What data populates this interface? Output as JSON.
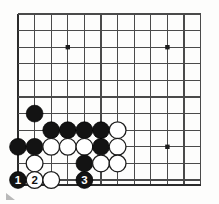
{
  "figure": {
    "kind": "go-board-diagram",
    "board_color": "#fdfdfc",
    "line_color": "#4a4a4a",
    "edge_line_color": "#2b2b2b",
    "black_color": "#131313",
    "white_color": "#ffffff"
  },
  "board": {
    "origin_x": 18,
    "origin_y": 14,
    "spacing": 16.6,
    "cols": 12,
    "rows": 11,
    "bottom_edge_y": 185,
    "star_points": [
      {
        "name": "star-point-upper-left",
        "col": 3,
        "row": 2
      },
      {
        "name": "star-point-upper-right",
        "col": 9,
        "row": 2
      },
      {
        "name": "star-point-lower-right",
        "col": 9,
        "row": 8
      }
    ]
  },
  "stones": [
    {
      "name": "stone-black-a",
      "color": "black",
      "col": 1,
      "row": 6,
      "label": ""
    },
    {
      "name": "stone-black-b",
      "color": "black",
      "col": 2,
      "row": 7,
      "label": ""
    },
    {
      "name": "stone-black-c",
      "color": "black",
      "col": 3,
      "row": 7,
      "label": ""
    },
    {
      "name": "stone-black-d",
      "color": "black",
      "col": 4,
      "row": 7,
      "label": ""
    },
    {
      "name": "stone-black-e",
      "color": "black",
      "col": 5,
      "row": 7,
      "label": ""
    },
    {
      "name": "stone-white-f",
      "color": "white",
      "col": 6,
      "row": 7,
      "label": ""
    },
    {
      "name": "stone-black-g",
      "color": "black",
      "col": 0,
      "row": 8,
      "label": ""
    },
    {
      "name": "stone-black-h",
      "color": "black",
      "col": 1,
      "row": 8,
      "label": ""
    },
    {
      "name": "stone-white-i",
      "color": "white",
      "col": 2,
      "row": 8,
      "label": ""
    },
    {
      "name": "stone-white-j",
      "color": "white",
      "col": 3,
      "row": 8,
      "label": ""
    },
    {
      "name": "stone-white-k",
      "color": "white",
      "col": 4,
      "row": 8,
      "label": ""
    },
    {
      "name": "stone-black-l",
      "color": "black",
      "col": 5,
      "row": 8,
      "label": ""
    },
    {
      "name": "stone-white-m",
      "color": "white",
      "col": 6,
      "row": 8,
      "label": ""
    },
    {
      "name": "stone-white-n",
      "color": "white",
      "col": 1,
      "row": 9,
      "label": ""
    },
    {
      "name": "stone-black-o",
      "color": "black",
      "col": 4,
      "row": 9,
      "label": ""
    },
    {
      "name": "stone-white-p",
      "color": "white",
      "col": 5,
      "row": 9,
      "label": ""
    },
    {
      "name": "stone-white-q",
      "color": "white",
      "col": 6,
      "row": 9,
      "label": ""
    },
    {
      "name": "stone-move-1",
      "color": "black",
      "col": 0,
      "row": 10,
      "label": "1"
    },
    {
      "name": "stone-move-2",
      "color": "white",
      "col": 1,
      "row": 10,
      "label": "2"
    },
    {
      "name": "stone-white-r",
      "color": "white",
      "col": 2,
      "row": 10,
      "label": ""
    },
    {
      "name": "stone-move-3",
      "color": "black",
      "col": 4,
      "row": 10,
      "label": "3"
    }
  ],
  "move_sequence": [
    {
      "number": "1",
      "color": "black"
    },
    {
      "number": "2",
      "color": "white"
    },
    {
      "number": "3",
      "color": "black"
    }
  ],
  "corner_mark": {
    "name": "page-corner-mark",
    "visible": true
  }
}
